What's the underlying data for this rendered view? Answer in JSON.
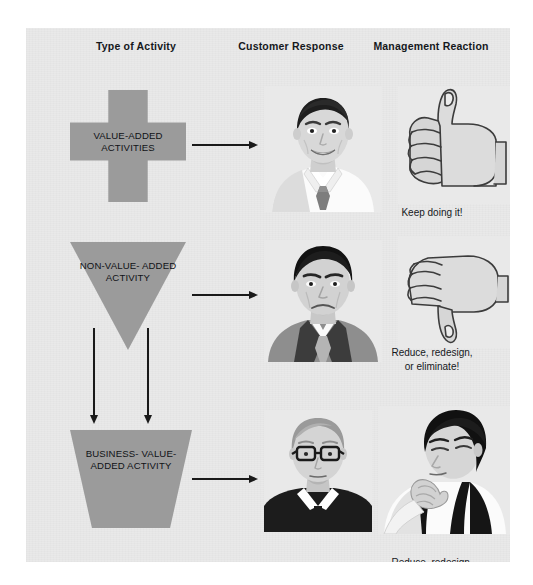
{
  "diagram": {
    "columns": {
      "activity": "Type of Activity",
      "customer": "Customer Response",
      "management": "Management Reaction"
    },
    "colors": {
      "panel_background": "#e9e9e9",
      "shape_fill": "#9b9b9b",
      "arrow": "#1a1a1a",
      "text": "#15181c"
    },
    "rows": [
      {
        "id": "value-added",
        "shape": "cross",
        "label": "VALUE-ADDED\nACTIVITIES",
        "customer_art": "smiling-businessman-portrait",
        "customer_mood": "pleased",
        "management_art": "thumbs-up-hand",
        "caption": "Keep doing it!"
      },
      {
        "id": "non-value-added",
        "shape": "inverted-triangle",
        "label": "NON-VALUE-\nADDED\nACTIVITY",
        "customer_art": "frowning-businessman-portrait",
        "customer_mood": "displeased",
        "management_art": "thumbs-down-hand",
        "caption": "Reduce, redesign,\nor eliminate!"
      },
      {
        "id": "business-value-added",
        "shape": "trapezoid",
        "label": "BUSINESS-\nVALUE-\nADDED\nACTIVITY",
        "customer_art": "neutral-person-with-glasses-portrait",
        "customer_mood": "neutral",
        "management_art": "pensive-man-hand-on-chin",
        "caption": "Reduce, redesign,\nor eliminate!"
      }
    ],
    "connectors": [
      {
        "id": "activity-to-customer-row-1",
        "direction": "right"
      },
      {
        "id": "activity-to-customer-row-2",
        "direction": "right"
      },
      {
        "id": "activity-to-customer-row-3",
        "direction": "right"
      },
      {
        "id": "triangle-to-trapezoid-left",
        "direction": "down"
      },
      {
        "id": "triangle-to-trapezoid-right",
        "direction": "down"
      }
    ]
  }
}
